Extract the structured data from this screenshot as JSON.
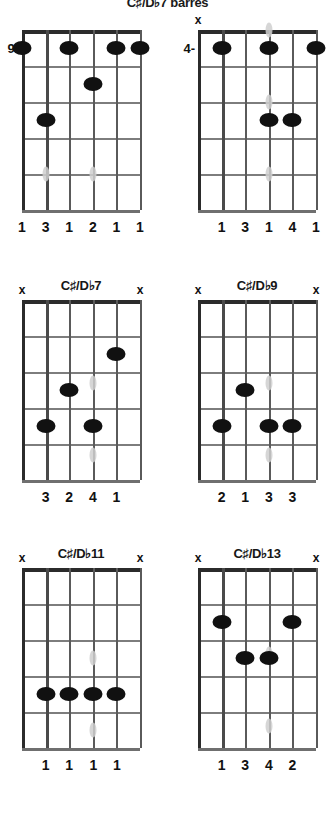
{
  "page": {
    "title": "C♯/D♭7 barres",
    "title_cut_off": true
  },
  "chart_data": {
    "type": "table",
    "title": "C♯/D♭7 barres",
    "instrument": "guitar",
    "strings": 6,
    "string_order": "low-to-high-left-to-right",
    "frets_shown": 5,
    "diagrams": [
      {
        "name": "C♯/D♭7 barre 9th position",
        "label": "",
        "label_visible": false,
        "position_marker": "9-",
        "position_fret": 9,
        "show_nut": false,
        "mutes": [],
        "dots": [
          {
            "string": 6,
            "fret": 1
          },
          {
            "string": 4,
            "fret": 1
          },
          {
            "string": 2,
            "fret": 1
          },
          {
            "string": 1,
            "fret": 1
          },
          {
            "string": 3,
            "fret": 2
          },
          {
            "string": 5,
            "fret": 3
          }
        ],
        "ghost_dots": [
          {
            "string": 5,
            "fret": 4.5
          },
          {
            "string": 3,
            "fret": 4.5
          }
        ],
        "fingering": [
          "1",
          "3",
          "1",
          "2",
          "1",
          "1"
        ]
      },
      {
        "name": "C♯/D♭7 barre 4th position",
        "label": "",
        "label_visible": false,
        "position_marker": "4-",
        "position_fret": 4,
        "show_nut": false,
        "mutes": [
          6
        ],
        "dots": [
          {
            "string": 5,
            "fret": 1
          },
          {
            "string": 3,
            "fret": 1
          },
          {
            "string": 1,
            "fret": 1
          },
          {
            "string": 3,
            "fret": 3
          },
          {
            "string": 2,
            "fret": 3
          }
        ],
        "ghost_dots": [
          {
            "string": 3,
            "fret": 0.5
          },
          {
            "string": 3,
            "fret": 2.5
          },
          {
            "string": 3,
            "fret": 4.5
          }
        ],
        "fingering": [
          "1",
          "3",
          "1",
          "4",
          "1"
        ]
      },
      {
        "name": "C♯/D♭7",
        "label": "C♯/D♭7",
        "label_visible": true,
        "position_marker": "",
        "show_nut": true,
        "mutes": [
          6,
          1
        ],
        "dots": [
          {
            "string": 2,
            "fret": 2
          },
          {
            "string": 4,
            "fret": 3
          },
          {
            "string": 5,
            "fret": 4
          },
          {
            "string": 3,
            "fret": 4
          }
        ],
        "ghost_dots": [
          {
            "string": 3,
            "fret": 2.8
          },
          {
            "string": 3,
            "fret": 4.8
          }
        ],
        "fingering": [
          "3",
          "2",
          "4",
          "1"
        ]
      },
      {
        "name": "C♯/D♭9",
        "label": "C♯/D♭9",
        "label_visible": true,
        "position_marker": "",
        "show_nut": true,
        "mutes": [
          6,
          1
        ],
        "dots": [
          {
            "string": 4,
            "fret": 3
          },
          {
            "string": 5,
            "fret": 4
          },
          {
            "string": 3,
            "fret": 4
          },
          {
            "string": 2,
            "fret": 4
          }
        ],
        "ghost_dots": [
          {
            "string": 3,
            "fret": 2.8
          },
          {
            "string": 3,
            "fret": 4.8
          }
        ],
        "fingering": [
          "2",
          "1",
          "3",
          "3"
        ]
      },
      {
        "name": "C♯/D♭11",
        "label": "C♯/D♭11",
        "label_visible": true,
        "position_marker": "",
        "show_nut": true,
        "mutes": [
          6,
          1
        ],
        "dots": [
          {
            "string": 5,
            "fret": 4
          },
          {
            "string": 4,
            "fret": 4
          },
          {
            "string": 3,
            "fret": 4
          },
          {
            "string": 2,
            "fret": 4
          }
        ],
        "ghost_dots": [
          {
            "string": 3,
            "fret": 3
          },
          {
            "string": 3,
            "fret": 5
          }
        ],
        "fingering": [
          "1",
          "1",
          "1",
          "1"
        ]
      },
      {
        "name": "C♯/D♭13",
        "label": "C♯/D♭13",
        "label_visible": true,
        "position_marker": "",
        "show_nut": true,
        "mutes": [
          6,
          1
        ],
        "dots": [
          {
            "string": 5,
            "fret": 2
          },
          {
            "string": 2,
            "fret": 2
          },
          {
            "string": 4,
            "fret": 3
          },
          {
            "string": 3,
            "fret": 3
          }
        ],
        "ghost_dots": [
          {
            "string": 3,
            "fret": 2.9
          },
          {
            "string": 3,
            "fret": 4.9
          }
        ],
        "fingering": [
          "1",
          "3",
          "4",
          "2"
        ]
      }
    ]
  }
}
